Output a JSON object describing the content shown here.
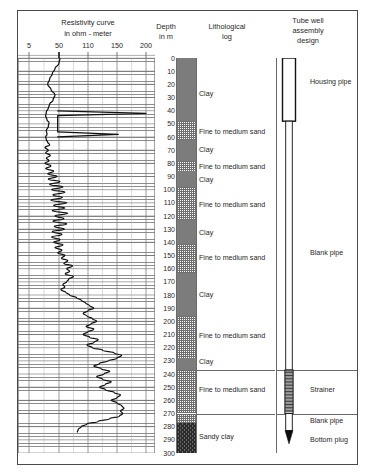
{
  "figure": {
    "title_resistivity": "Resistivity curve",
    "subtitle_resistivity": "in ohm - meter",
    "title_depth": "Depth",
    "subtitle_depth": "in m",
    "title_litho_1": "Lithological",
    "title_litho_2": "log",
    "title_well_1": "Tube well",
    "title_well_2": "assembly",
    "title_well_3": "design"
  },
  "chart_data": {
    "type": "line",
    "title": "Resistivity curve",
    "xlabel": "in ohm - meter",
    "ylabel": "Depth in m",
    "xticks": [
      5,
      50,
      110,
      150,
      200
    ],
    "xtick_labels": [
      "5",
      "50",
      "110",
      "150",
      "200"
    ],
    "ylim": [
      0,
      300
    ],
    "yticks": [
      0,
      10,
      20,
      30,
      40,
      50,
      60,
      70,
      80,
      90,
      100,
      110,
      120,
      130,
      140,
      150,
      160,
      170,
      180,
      190,
      200,
      210,
      220,
      230,
      240,
      250,
      260,
      270,
      280,
      290,
      300
    ],
    "ytick_labels": [
      "0",
      "10",
      "20",
      "30",
      "40",
      "50",
      "60",
      "70",
      "80",
      "90",
      "100",
      "110",
      "120",
      "130",
      "140",
      "150",
      "160",
      "170",
      "180",
      "190",
      "200",
      "210",
      "220",
      "230",
      "240",
      "250",
      "260",
      "270",
      "280",
      "290",
      "300"
    ],
    "grid": true,
    "orientation": "vertical-depth",
    "series": [
      {
        "name": "Resistivity",
        "points": [
          [
            52,
            0
          ],
          [
            50,
            4
          ],
          [
            44,
            8
          ],
          [
            40,
            12
          ],
          [
            36,
            16
          ],
          [
            33,
            20
          ],
          [
            38,
            24
          ],
          [
            44,
            28
          ],
          [
            41,
            32
          ],
          [
            36,
            35
          ],
          [
            34,
            38
          ],
          [
            31,
            41
          ],
          [
            30,
            44
          ],
          [
            32,
            47
          ],
          [
            35,
            49
          ],
          [
            34,
            52
          ],
          [
            31,
            55
          ],
          [
            32,
            58
          ],
          [
            30,
            60
          ],
          [
            31,
            62
          ],
          [
            33,
            64
          ],
          [
            36,
            66
          ],
          [
            29,
            68
          ],
          [
            34,
            70
          ],
          [
            30,
            72
          ],
          [
            37,
            74
          ],
          [
            31,
            76
          ],
          [
            35,
            78
          ],
          [
            29,
            80
          ],
          [
            38,
            82
          ],
          [
            30,
            84
          ],
          [
            42,
            86
          ],
          [
            33,
            88
          ],
          [
            47,
            90
          ],
          [
            34,
            92
          ],
          [
            52,
            94
          ],
          [
            36,
            96
          ],
          [
            58,
            98
          ],
          [
            39,
            100
          ],
          [
            62,
            102
          ],
          [
            41,
            104
          ],
          [
            57,
            106
          ],
          [
            38,
            108
          ],
          [
            66,
            110
          ],
          [
            42,
            112
          ],
          [
            62,
            114
          ],
          [
            40,
            116
          ],
          [
            68,
            118
          ],
          [
            44,
            120
          ],
          [
            60,
            122
          ],
          [
            41,
            124
          ],
          [
            66,
            126
          ],
          [
            43,
            128
          ],
          [
            61,
            130
          ],
          [
            40,
            132
          ],
          [
            56,
            134
          ],
          [
            39,
            136
          ],
          [
            52,
            138
          ],
          [
            42,
            140
          ],
          [
            58,
            142
          ],
          [
            44,
            144
          ],
          [
            56,
            146
          ],
          [
            48,
            148
          ],
          [
            62,
            150
          ],
          [
            55,
            152
          ],
          [
            68,
            154
          ],
          [
            60,
            156
          ],
          [
            78,
            158
          ],
          [
            66,
            160
          ],
          [
            72,
            162
          ],
          [
            63,
            164
          ],
          [
            80,
            166
          ],
          [
            70,
            168
          ],
          [
            66,
            170
          ],
          [
            58,
            172
          ],
          [
            62,
            174
          ],
          [
            54,
            176
          ],
          [
            64,
            178
          ],
          [
            72,
            180
          ],
          [
            86,
            182
          ],
          [
            96,
            184
          ],
          [
            105,
            186
          ],
          [
            112,
            188
          ],
          [
            118,
            190
          ],
          [
            110,
            192
          ],
          [
            100,
            194
          ],
          [
            108,
            196
          ],
          [
            116,
            198
          ],
          [
            122,
            200
          ],
          [
            114,
            202
          ],
          [
            106,
            204
          ],
          [
            118,
            206
          ],
          [
            110,
            208
          ],
          [
            100,
            210
          ],
          [
            112,
            212
          ],
          [
            124,
            214
          ],
          [
            118,
            216
          ],
          [
            108,
            218
          ],
          [
            116,
            220
          ],
          [
            130,
            222
          ],
          [
            146,
            224
          ],
          [
            158,
            226
          ],
          [
            150,
            228
          ],
          [
            138,
            230
          ],
          [
            126,
            232
          ],
          [
            118,
            234
          ],
          [
            128,
            236
          ],
          [
            140,
            238
          ],
          [
            132,
            240
          ],
          [
            122,
            242
          ],
          [
            130,
            244
          ],
          [
            142,
            246
          ],
          [
            134,
            248
          ],
          [
            126,
            250
          ],
          [
            134,
            252
          ],
          [
            146,
            254
          ],
          [
            156,
            256
          ],
          [
            150,
            258
          ],
          [
            142,
            260
          ],
          [
            150,
            262
          ],
          [
            158,
            264
          ],
          [
            162,
            266
          ],
          [
            156,
            268
          ],
          [
            160,
            270
          ],
          [
            154,
            272
          ],
          [
            140,
            274
          ],
          [
            124,
            276
          ],
          [
            108,
            278
          ],
          [
            96,
            280
          ],
          [
            90,
            282
          ],
          [
            88,
            284
          ]
        ],
        "spikes": [
          {
            "depth": 42,
            "max": 200,
            "base": 48
          },
          {
            "depth": 58,
            "max": 152,
            "base": 48
          }
        ]
      }
    ]
  },
  "lithology": {
    "column_beds": [
      {
        "from": 0,
        "to": 48,
        "type": "clay"
      },
      {
        "from": 48,
        "to": 62,
        "type": "sand"
      },
      {
        "from": 62,
        "to": 78,
        "type": "clay"
      },
      {
        "from": 78,
        "to": 86,
        "type": "sand"
      },
      {
        "from": 86,
        "to": 98,
        "type": "clay"
      },
      {
        "from": 98,
        "to": 123,
        "type": "sand"
      },
      {
        "from": 123,
        "to": 141,
        "type": "clay"
      },
      {
        "from": 141,
        "to": 163,
        "type": "sand"
      },
      {
        "from": 163,
        "to": 196,
        "type": "clay"
      },
      {
        "from": 196,
        "to": 228,
        "type": "sand"
      },
      {
        "from": 228,
        "to": 237,
        "type": "clay"
      },
      {
        "from": 237,
        "to": 270,
        "type": "sand"
      },
      {
        "from": 270,
        "to": 277,
        "type": "sand"
      },
      {
        "from": 277,
        "to": 300,
        "type": "sandy-clay"
      }
    ],
    "labels": [
      {
        "depth": 27,
        "text": "Clay"
      },
      {
        "depth": 56,
        "text": "Fine to medium sand"
      },
      {
        "depth": 70,
        "text": "Clay"
      },
      {
        "depth": 83,
        "text": "Fine to medium sand"
      },
      {
        "depth": 93,
        "text": "Clay"
      },
      {
        "depth": 112,
        "text": "Fine to medium sand"
      },
      {
        "depth": 133,
        "text": "Clay"
      },
      {
        "depth": 152,
        "text": "Fine to medium sand"
      },
      {
        "depth": 180,
        "text": "Clay"
      },
      {
        "depth": 211,
        "text": "Fine to medium sand"
      },
      {
        "depth": 231,
        "text": "Clay"
      },
      {
        "depth": 252,
        "text": "Fine to medium sand"
      },
      {
        "depth": 288,
        "text": "Sandy clay"
      }
    ],
    "separators": [
      237,
      270
    ]
  },
  "well_assembly": {
    "sections": [
      {
        "label": "Housing pipe",
        "from": 0,
        "to": 48
      },
      {
        "label": "Blank pipe",
        "from": 48,
        "to": 237
      },
      {
        "label": "Strainer",
        "from": 237,
        "to": 270
      },
      {
        "label": "Blank pipe",
        "from": 270,
        "to": 283
      },
      {
        "label": "Bottom plug",
        "from": 283,
        "to": 295
      }
    ],
    "separators": [
      237,
      270
    ],
    "label_positions": [
      {
        "text": "Housing pipe",
        "depth": 18
      },
      {
        "text": "Blank pipe",
        "depth": 148
      },
      {
        "text": "Strainer",
        "depth": 252
      },
      {
        "text": "Blank pipe",
        "depth": 276
      },
      {
        "text": "Bottom plug",
        "depth": 290
      }
    ]
  },
  "colors": {
    "clay": "#7c7c7c",
    "sand_line": "#6f6f6f",
    "sandy_clay": "#2b2b2b",
    "grid": "#8d8d8d",
    "curve": "#111111",
    "frame": "#4a4a4a",
    "text": "#1f1f1f"
  }
}
